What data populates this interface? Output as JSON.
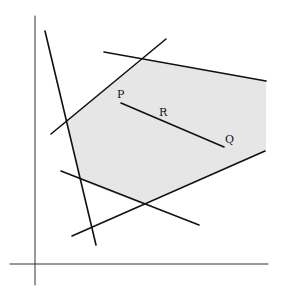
{
  "diagram": {
    "type": "feasible-region",
    "background": "#ffffff",
    "region_fill": "#e6e6e6",
    "line_color": "#111111",
    "axes": {
      "y_axis": {
        "x1": 35,
        "y1": 16,
        "x2": 35,
        "y2": 285
      },
      "x_axis": {
        "x1": 10,
        "y1": 264,
        "x2": 268,
        "y2": 264
      }
    },
    "constraint_lines": [
      {
        "name": "steep-line",
        "x1": 45,
        "y1": 31,
        "x2": 96,
        "y2": 245
      },
      {
        "name": "upper-left-line",
        "x1": 51,
        "y1": 134,
        "x2": 166,
        "y2": 39
      },
      {
        "name": "top-line",
        "x1": 104,
        "y1": 52,
        "x2": 266,
        "y2": 81
      },
      {
        "name": "lower-right-line",
        "x1": 72,
        "y1": 236,
        "x2": 265,
        "y2": 151
      },
      {
        "name": "lower-left-line",
        "x1": 61,
        "y1": 171,
        "x2": 199,
        "y2": 225
      }
    ],
    "region_polygon": "67,120 143,60 266,81 266,151 141,204 80,180",
    "segment": {
      "x1": 121,
      "y1": 103,
      "x2": 224,
      "y2": 147
    },
    "labels": {
      "P": {
        "text": "P",
        "x": 117,
        "y": 98
      },
      "R": {
        "text": "R",
        "x": 159,
        "y": 116
      },
      "Q": {
        "text": "Q",
        "x": 225,
        "y": 143
      }
    }
  }
}
